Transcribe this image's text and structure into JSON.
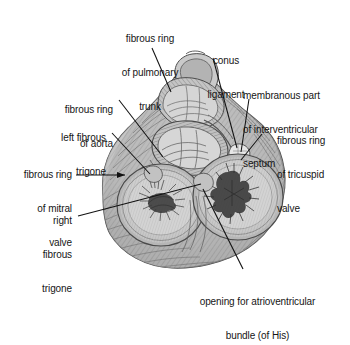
{
  "figure": {
    "background_color": "#ffffff",
    "ink_color": "#161616",
    "tones": {
      "muscle_light": "#c9c9c9",
      "muscle_mid": "#a8a8a8",
      "muscle_dark": "#7d7d7d",
      "ring_pale": "#d9d9d9",
      "valve_interior": "#cfcfcf",
      "shadow": "#6a6a6a"
    }
  },
  "labels": {
    "pulmonary_trunk": {
      "lines": [
        "fibrous ring",
        "of pulmonary",
        "trunk"
      ],
      "text": "fibrous ring of pulmonary trunk",
      "align": "center"
    },
    "conus_ligament": {
      "lines": [
        "conus",
        "ligament"
      ],
      "text": "conus ligament",
      "align": "center"
    },
    "membranous_septum": {
      "lines": [
        "membranous part",
        "of interventricular",
        "septum"
      ],
      "text": "membranous part of interventricular septum",
      "align": "left"
    },
    "aorta": {
      "lines": [
        "fibrous ring",
        "of aorta"
      ],
      "text": "fibrous ring of aorta",
      "align": "right"
    },
    "left_fibrous_trigone": {
      "lines": [
        "left fibrous",
        "trigone"
      ],
      "text": "left fibrous trigone",
      "align": "right"
    },
    "mitral_valve": {
      "lines": [
        "fibrous ring",
        "of mitral",
        "valve"
      ],
      "text": "fibrous ring of mitral valve",
      "align": "right"
    },
    "right_fibrous_trigone": {
      "lines": [
        "right",
        "fibrous",
        "trigone"
      ],
      "text": "right fibrous trigone",
      "align": "right"
    },
    "tricuspid_valve": {
      "lines": [
        "fibrous ring",
        "of tricuspid",
        "valve"
      ],
      "text": "fibrous ring of tricuspid valve",
      "align": "left"
    },
    "av_bundle": {
      "lines": [
        "opening for atrioventricular",
        "bundle (of His)"
      ],
      "text": "opening for atrioventricular bundle (of His)",
      "align": "center"
    }
  }
}
